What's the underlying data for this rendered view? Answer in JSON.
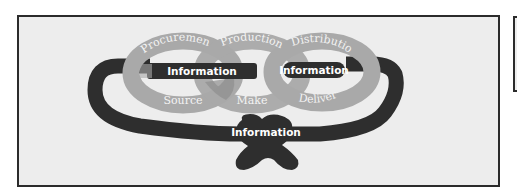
{
  "diagram": {
    "rings": [
      {
        "id": "procurement",
        "top_label": "Procurement",
        "bottom_label": "Source"
      },
      {
        "id": "production",
        "top_label": "Production",
        "bottom_label": "Make"
      },
      {
        "id": "distribution",
        "top_label": "Distribution",
        "bottom_label": "Deliver"
      }
    ],
    "information_band_labels": {
      "left_band": "Information",
      "right_band": "Information",
      "knot": "Information"
    },
    "colors": {
      "background": "#ededed",
      "frame_border": "#2b2b2b",
      "ring_fill": "#a9a9a9",
      "ring_overlap": "#8e8e8e",
      "information_band": "#2e2e2e",
      "label_text": "#ffffff"
    }
  }
}
